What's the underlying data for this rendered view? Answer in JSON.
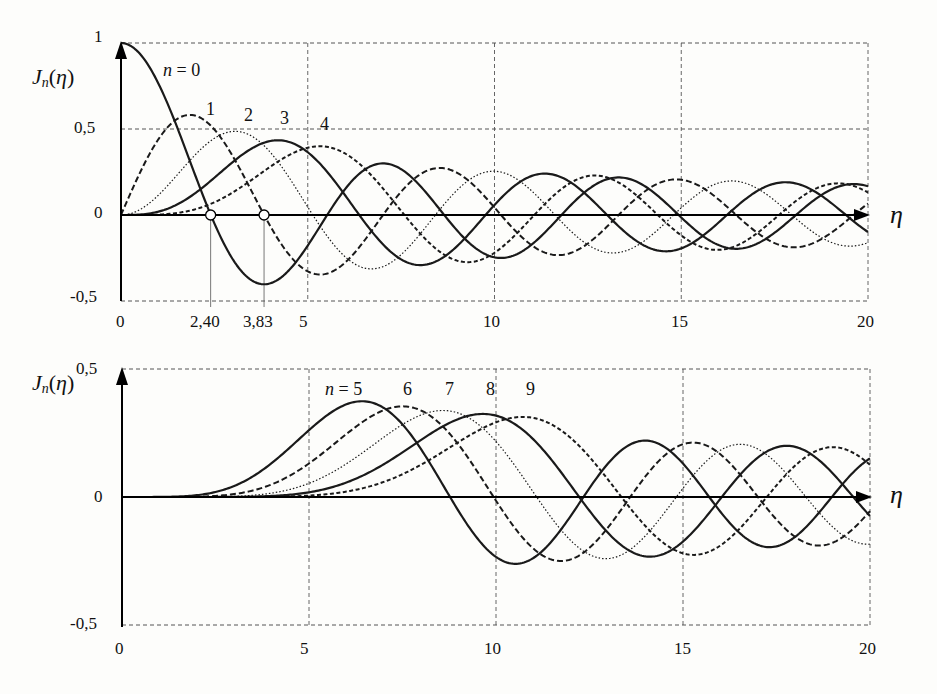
{
  "chart_data": [
    {
      "type": "line",
      "title": "",
      "function": "besselJ",
      "ylabel": "Jn(η)",
      "xlabel": "η",
      "xlim": [
        0,
        20
      ],
      "ylim": [
        -0.5,
        1
      ],
      "grid": true,
      "x_ticks": [
        "0",
        "2,40",
        "3,83",
        "5",
        "10",
        "15",
        "20"
      ],
      "x_tick_values": [
        0,
        2.4,
        3.83,
        5,
        10,
        15,
        20
      ],
      "y_ticks": [
        "1",
        "0,5",
        "0",
        "-0,5"
      ],
      "y_tick_values": [
        1,
        0.5,
        0,
        -0.5
      ],
      "annotations": [
        {
          "text": "2,40",
          "x": 2.4,
          "y": 0,
          "note": "first zero of J0 (circle marker)"
        },
        {
          "text": "3,83",
          "x": 3.83,
          "y": 0,
          "note": "first zero of J1 (circle marker)"
        }
      ],
      "series": [
        {
          "name": "n = 0",
          "n": 0,
          "style": "solid",
          "peak": {
            "x": 0,
            "y": 1.0
          }
        },
        {
          "name": "1",
          "n": 1,
          "style": "dashed",
          "peak": {
            "x": 1.84,
            "y": 0.58
          }
        },
        {
          "name": "2",
          "n": 2,
          "style": "dotted",
          "peak": {
            "x": 3.05,
            "y": 0.49
          }
        },
        {
          "name": "3",
          "n": 3,
          "style": "solid",
          "peak": {
            "x": 4.2,
            "y": 0.43
          }
        },
        {
          "name": "4",
          "n": 4,
          "style": "dashed2",
          "peak": {
            "x": 5.32,
            "y": 0.4
          }
        }
      ]
    },
    {
      "type": "line",
      "title": "",
      "function": "besselJ",
      "ylabel": "Jn(η)",
      "xlabel": "η",
      "xlim": [
        0,
        20
      ],
      "ylim": [
        -0.5,
        0.5
      ],
      "grid": true,
      "x_ticks": [
        "0",
        "5",
        "10",
        "15",
        "20"
      ],
      "x_tick_values": [
        0,
        5,
        10,
        15,
        20
      ],
      "y_ticks": [
        "0,5",
        "0",
        "-0,5"
      ],
      "y_tick_values": [
        0.5,
        0,
        -0.5
      ],
      "series": [
        {
          "name": "n = 5",
          "n": 5,
          "style": "solid",
          "peak": {
            "x": 6.42,
            "y": 0.37
          }
        },
        {
          "name": "6",
          "n": 6,
          "style": "dashed",
          "peak": {
            "x": 7.5,
            "y": 0.34
          }
        },
        {
          "name": "7",
          "n": 7,
          "style": "dotted",
          "peak": {
            "x": 8.58,
            "y": 0.32
          }
        },
        {
          "name": "8",
          "n": 8,
          "style": "solid",
          "peak": {
            "x": 9.65,
            "y": 0.31
          }
        },
        {
          "name": "9",
          "n": 9,
          "style": "dashed2",
          "peak": {
            "x": 10.71,
            "y": 0.29
          }
        }
      ]
    }
  ],
  "top": {
    "ylabel_main": "J",
    "ylabel_sub": "n",
    "ylabel_arg": "(η)",
    "xaxis_symbol": "η",
    "labels": {
      "n0": "n",
      "n0_rest": " = 0",
      "n1": "1",
      "n2": "2",
      "n3": "3",
      "n4": "4"
    },
    "yticks": {
      "t1": "1",
      "t05": "0,5",
      "t0": "0",
      "tm05": "-0,5"
    },
    "xticks": {
      "t0": "0",
      "t240": "2,40",
      "t383": "3,83",
      "t5": "5",
      "t10": "10",
      "t15": "15",
      "t20": "20"
    }
  },
  "bottom": {
    "ylabel_main": "J",
    "ylabel_sub": "n",
    "ylabel_arg": "(η)",
    "xaxis_symbol": "η",
    "labels": {
      "n5": "n",
      "n5_rest": " = 5",
      "n6": "6",
      "n7": "7",
      "n8": "8",
      "n9": "9"
    },
    "yticks": {
      "t05": "0,5",
      "t0": "0",
      "tm05": "-0,5"
    },
    "xticks": {
      "t0": "0",
      "t5": "5",
      "t10": "10",
      "t15": "15",
      "t20": "20"
    }
  },
  "styles": {
    "line_color": "#1a1a1a",
    "grid_color": "#555555"
  }
}
